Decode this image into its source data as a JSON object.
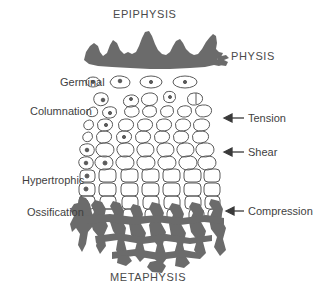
{
  "figure": {
    "title_top": "EPIPHYSIS",
    "title_bottom": "METAPHYSIS",
    "side_label": "PHYSIS"
  },
  "zone_labels": [
    {
      "id": "germinal",
      "text": "Germinal"
    },
    {
      "id": "columnation",
      "text": "Columnation"
    },
    {
      "id": "hypertrophic",
      "text": "Hypertrophic"
    },
    {
      "id": "ossification",
      "text": "Ossification"
    }
  ],
  "force_labels": [
    {
      "id": "tension",
      "text": "Tension"
    },
    {
      "id": "shear",
      "text": "Shear"
    },
    {
      "id": "compression",
      "text": "Compression"
    }
  ],
  "colors": {
    "background": "#ffffff",
    "bone": "#6b6b6b",
    "cell_outline": "#5a5a5a",
    "text": "#3f3f3f",
    "arrow": "#3a3a3a"
  }
}
